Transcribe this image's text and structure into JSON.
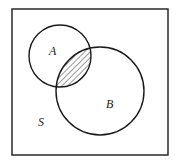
{
  "diagram": {
    "type": "venn",
    "universe": {
      "label": "S",
      "x": 12,
      "y": 9,
      "width": 156,
      "height": 146
    },
    "sets": [
      {
        "label": "A",
        "cx": 60,
        "cy": 56,
        "r": 31
      },
      {
        "label": "B",
        "cx": 100,
        "cy": 91,
        "r": 44
      }
    ],
    "shaded_region": "A ∩ B",
    "shading": "diagonal-hatch",
    "colors": {
      "stroke": "#1a1a1a",
      "background": "#ffffff",
      "hatch": "#333333"
    }
  }
}
